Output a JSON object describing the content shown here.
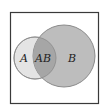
{
  "diagram": {
    "type": "venn",
    "frame": {
      "stroke": "#3a3a3a"
    },
    "sets": [
      {
        "id": "A",
        "label": "A",
        "fill": "#e4e4e4",
        "stroke": "#9a9a9a"
      },
      {
        "id": "B",
        "label": "B",
        "fill": "#bdbdbd",
        "stroke": "#8c8c8c"
      }
    ],
    "intersection": {
      "label": "AB",
      "fill": "#a6a6a6"
    }
  }
}
